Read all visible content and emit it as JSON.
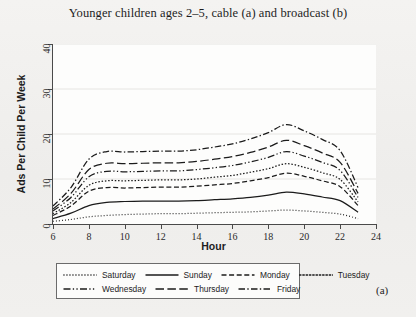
{
  "figure": {
    "title": "Younger children ages 2–5, cable (a) and broadcast (b)",
    "panel_tag": "(a)"
  },
  "chart_data": {
    "type": "line",
    "title": "Younger children ages 2–5, cable (a) and broadcast (b)",
    "xlabel": "Hour",
    "ylabel": "Ads Per Child Per Week",
    "xlim": [
      6,
      24
    ],
    "ylim": [
      0,
      40
    ],
    "xticks": [
      6,
      8,
      10,
      12,
      14,
      16,
      18,
      20,
      22,
      24
    ],
    "yticks": [
      0,
      10,
      20,
      30,
      40
    ],
    "xtick_labels": [
      "6",
      "8",
      "10",
      "12",
      "14",
      "16",
      "18",
      "20",
      "22",
      "24"
    ],
    "ytick_labels": [
      "0",
      "10",
      "20",
      "30",
      "40"
    ],
    "grid": "horizontal",
    "legend_position": "below-plot",
    "x": [
      6,
      7,
      8,
      9,
      10,
      11,
      12,
      13,
      14,
      15,
      16,
      17,
      18,
      19,
      20,
      21,
      22,
      23
    ],
    "series": [
      {
        "name": "Saturday",
        "style": "dotted-fine",
        "dasharray": "0.9 2.1",
        "values": [
          0.6,
          1.0,
          1.6,
          1.9,
          2.1,
          2.2,
          2.3,
          2.3,
          2.4,
          2.5,
          2.6,
          2.7,
          2.9,
          3.1,
          2.9,
          2.6,
          2.2,
          1.2
        ]
      },
      {
        "name": "Sunday",
        "style": "solid",
        "dasharray": "none",
        "values": [
          1.2,
          2.4,
          4.1,
          4.8,
          5.0,
          5.1,
          5.1,
          5.1,
          5.2,
          5.4,
          5.6,
          5.9,
          6.4,
          7.1,
          6.7,
          6.0,
          5.2,
          2.6
        ]
      },
      {
        "name": "Monday",
        "style": "dashed",
        "dasharray": "5 2.6",
        "values": [
          1.9,
          4.0,
          7.3,
          8.1,
          8.0,
          8.1,
          8.2,
          8.2,
          8.4,
          8.7,
          9.0,
          9.6,
          10.3,
          11.3,
          10.6,
          9.6,
          8.3,
          4.1
        ]
      },
      {
        "name": "Tuesday",
        "style": "dotted",
        "dasharray": "1.5 1.8",
        "values": [
          2.3,
          4.8,
          8.6,
          9.6,
          9.6,
          9.7,
          9.8,
          9.8,
          10.0,
          10.4,
          10.8,
          11.5,
          12.3,
          13.4,
          12.6,
          11.4,
          9.9,
          4.9
        ]
      },
      {
        "name": "Wednesday",
        "style": "dash-dot-dot",
        "dasharray": "7 2.3 1.3 2.3 1.3 2.3",
        "values": [
          2.9,
          5.9,
          10.5,
          11.7,
          11.6,
          11.7,
          11.8,
          11.8,
          12.1,
          12.5,
          13.0,
          13.8,
          14.8,
          16.1,
          15.1,
          13.7,
          11.9,
          5.9
        ]
      },
      {
        "name": "Thursday",
        "style": "long-dash",
        "dasharray": "8.5 3.4",
        "values": [
          3.3,
          6.8,
          12.1,
          13.5,
          13.4,
          13.5,
          13.6,
          13.6,
          13.9,
          14.4,
          15.0,
          15.9,
          17.1,
          18.6,
          17.4,
          15.8,
          13.7,
          6.8
        ]
      },
      {
        "name": "Friday",
        "style": "dash-dot",
        "dasharray": "6.5 2.3 1.4 2.3",
        "values": [
          4.0,
          8.1,
          14.4,
          16.1,
          16.0,
          16.1,
          16.2,
          16.2,
          16.5,
          17.1,
          17.8,
          18.9,
          20.3,
          22.1,
          20.7,
          18.8,
          16.3,
          8.1
        ]
      }
    ]
  },
  "axes": {
    "y_title": "Ads Per Child Per Week",
    "x_title": "Hour"
  },
  "legend": {
    "rows": [
      [
        {
          "label": "Saturday",
          "series": 0
        },
        {
          "label": "Sunday",
          "series": 1
        },
        {
          "label": "Monday",
          "series": 2
        },
        {
          "label": "Tuesday",
          "series": 3
        }
      ],
      [
        {
          "label": "Wednesday",
          "series": 4
        },
        {
          "label": "Thursday",
          "series": 5
        },
        {
          "label": "Friday",
          "series": 6
        }
      ]
    ]
  },
  "colors": {
    "ink": "#1b1b1b",
    "axis": "#4a4a4a",
    "grid": "#e6e5e2",
    "paper": "#f0efed",
    "plot_bg": "#fdfdfc"
  }
}
